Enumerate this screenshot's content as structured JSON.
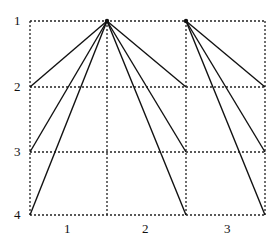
{
  "diagram": {
    "row_labels": [
      {
        "text": "1",
        "x": 14,
        "y": 14
      },
      {
        "text": "2",
        "x": 14,
        "y": 80
      },
      {
        "text": "3",
        "x": 14,
        "y": 145
      },
      {
        "text": "4",
        "x": 14,
        "y": 208
      }
    ],
    "col_labels": [
      {
        "text": "1",
        "x": 64,
        "y": 222
      },
      {
        "text": "2",
        "x": 142,
        "y": 222
      },
      {
        "text": "3",
        "x": 224,
        "y": 222
      }
    ],
    "grid": {
      "x": [
        30,
        107,
        186,
        265
      ],
      "y": [
        21,
        87,
        152,
        215
      ],
      "color": "#222222"
    },
    "apexes": [
      {
        "x": 107,
        "y": 21
      },
      {
        "x": 186,
        "y": 21
      }
    ],
    "lines": [
      {
        "from": [
          107,
          21
        ],
        "to": [
          30,
          87
        ]
      },
      {
        "from": [
          107,
          21
        ],
        "to": [
          30,
          152
        ]
      },
      {
        "from": [
          107,
          21
        ],
        "to": [
          30,
          215
        ]
      },
      {
        "from": [
          107,
          21
        ],
        "to": [
          186,
          87
        ]
      },
      {
        "from": [
          107,
          21
        ],
        "to": [
          186,
          152
        ]
      },
      {
        "from": [
          107,
          21
        ],
        "to": [
          186,
          215
        ]
      },
      {
        "from": [
          186,
          21
        ],
        "to": [
          265,
          87
        ]
      },
      {
        "from": [
          186,
          21
        ],
        "to": [
          265,
          152
        ]
      },
      {
        "from": [
          186,
          21
        ],
        "to": [
          265,
          215
        ]
      }
    ],
    "line_color": "#111111"
  }
}
